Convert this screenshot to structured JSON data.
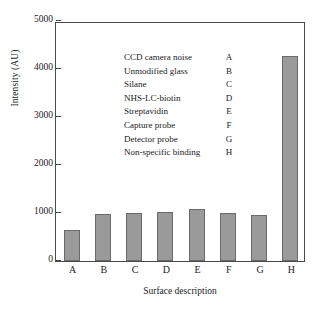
{
  "chart_data": {
    "type": "bar",
    "title": "",
    "xlabel": "Surface description",
    "ylabel": "Intensity (AU)",
    "categories": [
      "A",
      "B",
      "C",
      "D",
      "E",
      "F",
      "G",
      "H"
    ],
    "values": [
      645,
      985,
      990,
      1020,
      1075,
      995,
      960,
      4280
    ],
    "ylim": [
      0,
      5000
    ],
    "yticks": [
      0,
      1000,
      2000,
      3000,
      4000,
      5000
    ],
    "ytick_labels": [
      "0",
      "1000",
      "2000",
      "3000",
      "4000",
      "5000"
    ],
    "grid": false,
    "legend_position": "inside-top-left",
    "bar_color": "#9a9a9a",
    "bar_edge_color": "#6a6a6a",
    "axis_color": "#4a4a4a",
    "legend": [
      {
        "description": "CCD camera noise",
        "key": "A"
      },
      {
        "description": "Unmodified glass",
        "key": "B"
      },
      {
        "description": "Silane",
        "key": "C"
      },
      {
        "description": "NHS-LC-biotin",
        "key": "D"
      },
      {
        "description": "Streptavidin",
        "key": "E"
      },
      {
        "description": "Capture probe",
        "key": "F"
      },
      {
        "description": "Detector probe",
        "key": "G"
      },
      {
        "description": "Non-specific binding",
        "key": "H"
      }
    ]
  }
}
